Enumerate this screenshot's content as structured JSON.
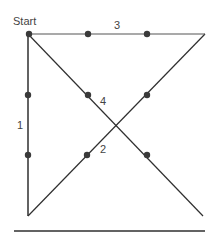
{
  "diagram": {
    "labels": {
      "start": "Start",
      "seg1": "1",
      "seg2": "2",
      "seg3": "3",
      "seg4": "4"
    },
    "colors": {
      "line": "#2f2f2f",
      "dot": "#3a3a3a",
      "text": "#444444"
    },
    "dots": [
      [
        28,
        34
      ],
      [
        88,
        34
      ],
      [
        148,
        34
      ],
      [
        28,
        95
      ],
      [
        88,
        95
      ],
      [
        148,
        95
      ],
      [
        28,
        155
      ],
      [
        88,
        155
      ],
      [
        148,
        155
      ]
    ]
  }
}
